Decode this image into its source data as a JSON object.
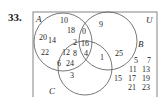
{
  "problem_number": "33.",
  "labels": {
    "A": "A",
    "B": "B",
    "C": "C",
    "U": "U"
  },
  "regions": {
    "A_only": [
      "10",
      "18",
      "20",
      "14",
      "22"
    ],
    "A_and_B_only": [
      "0"
    ],
    "A_and_C_only": [
      "12",
      "8",
      "6",
      "24",
      "2"
    ],
    "A_B_C": [
      "16",
      "4"
    ],
    "B_only": [
      "9",
      "25"
    ],
    "B_and_C_only": [
      "1"
    ],
    "C_only": [
      "3"
    ],
    "outside": [
      "5",
      "7",
      "11",
      "13",
      "15",
      "17",
      "19",
      "21",
      "23"
    ]
  },
  "colors": {
    "ink": "#1f1f1f",
    "line": "#555555",
    "background": "#ffffff"
  }
}
